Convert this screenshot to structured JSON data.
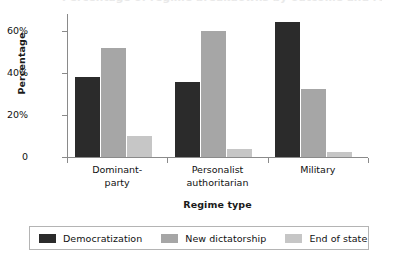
{
  "chart_data": {
    "type": "bar",
    "title": "Percentage of regime breakdowns by outcome and regime type",
    "xlabel": "Regime type",
    "ylabel": "Percentage",
    "categories": [
      "Dominant-party",
      "Personalist authoritarian",
      "Military"
    ],
    "category_lines": [
      [
        "Dominant-",
        "party"
      ],
      [
        "Personalist",
        "authoritarian"
      ],
      [
        "Military"
      ]
    ],
    "series": [
      {
        "name": "Democratization",
        "color": "#2b2b2b",
        "values": [
          38,
          35.5,
          64
        ]
      },
      {
        "name": "New dictatorship",
        "color": "#a6a6a6",
        "values": [
          52,
          60,
          32.5
        ]
      },
      {
        "name": "End of state",
        "color": "#c6c6c6",
        "values": [
          10,
          4,
          2.5
        ]
      }
    ],
    "ylim": [
      0,
      68
    ],
    "yticks": [
      0,
      20,
      40,
      60
    ],
    "ytick_labels": [
      "0",
      "20%",
      "40%",
      "60%"
    ],
    "grid": false,
    "legend_position": "bottom"
  },
  "axes": {
    "y_title": "Percentage",
    "x_title": "Regime type"
  },
  "legend": {
    "entries": [
      {
        "label": "Democratization"
      },
      {
        "label": "New dictatorship"
      },
      {
        "label": "End of state"
      }
    ]
  }
}
